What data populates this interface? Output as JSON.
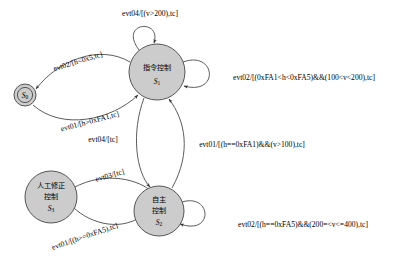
{
  "diagram": {
    "type": "state-machine",
    "title": "",
    "states": [
      {
        "id": "S0",
        "name_cn": "",
        "symbol": "S",
        "subscript": "0",
        "shape": "double-circle",
        "fill": "#cccccc",
        "stroke": "#555555",
        "cx": 25,
        "cy": 95,
        "r": 11
      },
      {
        "id": "S1",
        "name_cn": "指令控制",
        "symbol": "S",
        "subscript": "1",
        "shape": "circle",
        "fill": "#cccccc",
        "stroke": "#555555",
        "cx": 157,
        "cy": 72,
        "r": 28
      },
      {
        "id": "S2",
        "name_cn": "自主控制",
        "name_cn_line1": "自主",
        "name_cn_line2": "控制",
        "symbol": "S",
        "subscript": "2",
        "shape": "circle",
        "fill": "#cccccc",
        "stroke": "#555555",
        "cx": 159,
        "cy": 211,
        "r": 25
      },
      {
        "id": "S3",
        "name_cn": "人工修正控制",
        "name_cn_line1": "人工修正",
        "name_cn_line2": "控制",
        "symbol": "S",
        "subscript": "3",
        "shape": "circle",
        "fill": "#cccccc",
        "stroke": "#555555",
        "cx": 51,
        "cy": 197,
        "r": 26
      }
    ],
    "transitions": [
      {
        "id": "t1",
        "from": "S1",
        "to": "S1",
        "kind": "self-loop",
        "label": "evt04/[(v>200),tc]",
        "label_x": 150,
        "label_y": 14
      },
      {
        "id": "t2",
        "from": "S1",
        "to": "S0",
        "kind": "curve",
        "label": "evt02/[h<0x5,tc]",
        "label_x": 78,
        "label_y": 62
      },
      {
        "id": "t3",
        "from": "S0",
        "to": "S1",
        "kind": "curve",
        "label": "evt01/[h>0xFA1,tc]",
        "label_x": 90,
        "label_y": 122
      },
      {
        "id": "t4",
        "from": "S1",
        "to": "S1",
        "kind": "self-loop-right",
        "label": "evt02/[(0xFA1<h<0xFA5)&&(100<v<200),tc]",
        "label_x": 304,
        "label_y": 78
      },
      {
        "id": "t5",
        "from": "S1",
        "to": "S2",
        "kind": "curve",
        "label": "evt04/[tc]",
        "label_x": 103,
        "label_y": 140
      },
      {
        "id": "t6",
        "from": "S2",
        "to": "S1",
        "kind": "curve",
        "label": "evt01/[(h==0xFA1)&&(v>100),tc]",
        "label_x": 252,
        "label_y": 145
      },
      {
        "id": "t7",
        "from": "S3",
        "to": "S2",
        "kind": "curve",
        "label": "evt03/[tc]",
        "label_x": 110,
        "label_y": 176,
        "rotate": -16
      },
      {
        "id": "t8",
        "from": "S2",
        "to": "S3",
        "kind": "curve",
        "label": "evt01/[(h>=0xFA5),tc]",
        "label_x": 85,
        "label_y": 237,
        "rotate": -19
      },
      {
        "id": "t9",
        "from": "S2",
        "to": "S2",
        "kind": "self-loop-right",
        "label": "evt02/[(h==0xFA5)&&(200=<v<=400),tc]",
        "label_x": 303,
        "label_y": 225
      }
    ]
  }
}
